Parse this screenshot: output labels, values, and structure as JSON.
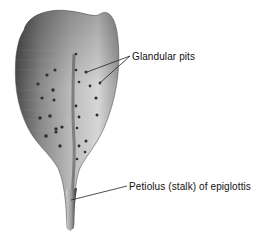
{
  "figure": {
    "subject": "Epiglottis",
    "labels": [
      {
        "id": "glandular-pits",
        "text": "Glandular pits"
      },
      {
        "id": "petiolus",
        "text": "Petiolus (stalk) of epiglottis"
      }
    ]
  },
  "colors": {
    "background": "#ffffff",
    "cartilage_light": "#d8d8d8",
    "cartilage_dark": "#6a6a6a",
    "pit": "#2e2e2e",
    "leader_line": "#222222",
    "text": "#111111"
  }
}
